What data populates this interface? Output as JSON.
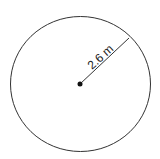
{
  "diagram": {
    "shape": "circle",
    "radius_label": "2.6 m",
    "colors": {
      "stroke": "#333333",
      "background": "#ffffff"
    }
  }
}
